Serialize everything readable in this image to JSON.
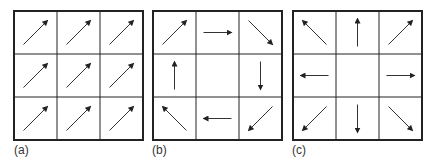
{
  "panels": [
    {
      "id": "a",
      "label": "(a)",
      "description": "Uniform field: all arrows point up-right",
      "cells": [
        [
          "up-right",
          "up-right",
          "up-right"
        ],
        [
          "up-right",
          "up-right",
          "up-right"
        ],
        [
          "up-right",
          "up-right",
          "up-right"
        ]
      ]
    },
    {
      "id": "b",
      "label": "(b)",
      "description": "Rotational (clockwise) field around empty center",
      "cells": [
        [
          "up-right",
          "right",
          "down-right"
        ],
        [
          "up",
          "none",
          "down"
        ],
        [
          "up-left",
          "left",
          "down-left"
        ]
      ]
    },
    {
      "id": "c",
      "label": "(c)",
      "description": "Divergent field: arrows point outward from empty center",
      "cells": [
        [
          "up-left",
          "up",
          "up-right"
        ],
        [
          "left",
          "none",
          "right"
        ],
        [
          "down-left",
          "down",
          "down-right"
        ]
      ]
    }
  ],
  "colors": {
    "grid_line": "#222222",
    "arrow": "#333333",
    "background": "#ffffff"
  }
}
